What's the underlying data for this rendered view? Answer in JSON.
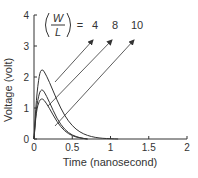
{
  "chart_data": {
    "type": "line",
    "title": "",
    "xlabel": "Time (nanosecond)",
    "ylabel": "Voltage (volt)",
    "xlim": [
      0,
      2
    ],
    "ylim": [
      0,
      4
    ],
    "x_ticks": [
      "0",
      "0.5",
      "1",
      "1.5",
      "2"
    ],
    "y_ticks": [
      "0",
      "1",
      "2",
      "3",
      "4"
    ],
    "grid": false,
    "annotation": {
      "fraction_numerator": "W",
      "fraction_denominator": "L",
      "equals": "=",
      "labels": [
        "4",
        "8",
        "10"
      ]
    },
    "series": [
      {
        "name": "W/L = 4",
        "x": [
          0,
          0.03,
          0.07,
          0.1,
          0.13,
          0.2,
          0.3,
          0.4,
          0.5,
          0.6,
          0.7,
          0.8,
          0.9,
          1.0,
          1.1
        ],
        "values": [
          0,
          1.3,
          2.1,
          2.25,
          2.2,
          1.85,
          1.25,
          0.75,
          0.42,
          0.22,
          0.11,
          0.05,
          0.02,
          0.01,
          0
        ]
      },
      {
        "name": "W/L = 8",
        "x": [
          0,
          0.03,
          0.07,
          0.1,
          0.13,
          0.2,
          0.3,
          0.4,
          0.5,
          0.6,
          0.7
        ],
        "values": [
          0,
          1.0,
          1.5,
          1.6,
          1.55,
          1.2,
          0.65,
          0.3,
          0.12,
          0.04,
          0
        ]
      },
      {
        "name": "W/L = 10",
        "x": [
          0,
          0.03,
          0.07,
          0.1,
          0.13,
          0.2,
          0.3,
          0.4,
          0.5,
          0.6,
          0.7
        ],
        "values": [
          0,
          0.9,
          1.25,
          1.3,
          1.27,
          1.0,
          0.55,
          0.25,
          0.1,
          0.03,
          0
        ]
      }
    ]
  }
}
